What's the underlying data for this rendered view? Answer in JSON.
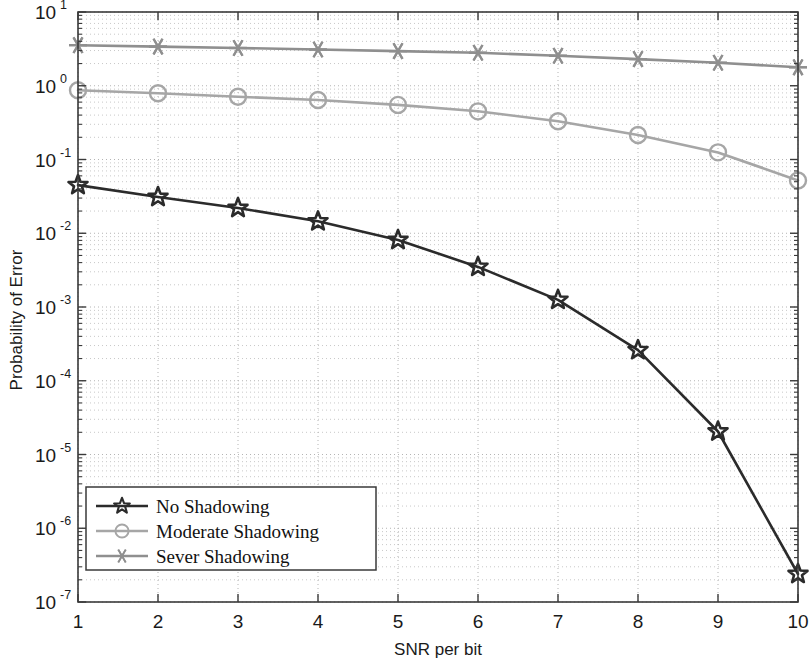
{
  "chart_data": {
    "type": "line",
    "title": "",
    "xlabel": "SNR per bit",
    "ylabel": "Probability of Error",
    "xscale": "linear",
    "yscale": "log",
    "xlim": [
      1,
      10
    ],
    "ylim": [
      1e-07,
      10
    ],
    "grid": true,
    "legend_position": "lower left",
    "x": [
      1,
      2,
      3,
      4,
      5,
      6,
      7,
      8,
      9,
      10
    ],
    "xtick_labels": [
      "1",
      "2",
      "3",
      "4",
      "5",
      "6",
      "7",
      "8",
      "9",
      "10"
    ],
    "ytick_labels": [
      "10⁷",
      "10⁶",
      "10⁵",
      "10⁴",
      "10³",
      "10²",
      "10¹",
      "10⁰",
      "10⁻¹"
    ],
    "ytick_bases": [
      "10",
      "10",
      "10",
      "10",
      "10",
      "10",
      "10",
      "10",
      "10"
    ],
    "ytick_exponents": [
      "1",
      "0",
      "-1",
      "-2",
      "-3",
      "-4",
      "-5",
      "-6",
      "-7"
    ],
    "ytick_values": [
      10,
      1,
      0.1,
      0.01,
      0.001,
      0.0001,
      1e-05,
      1e-06,
      1e-07
    ],
    "series": [
      {
        "name": "No Shadowing",
        "marker": "star-pentagram",
        "color": "#2b2b2b",
        "linewidth": 2.6,
        "values": [
          0.045,
          0.031,
          0.022,
          0.0145,
          0.0081,
          0.0035,
          0.00125,
          0.00026,
          2.05e-05,
          2.4e-07
        ]
      },
      {
        "name": "Moderate Shadowing",
        "marker": "circle",
        "color": "#a6a6a6",
        "linewidth": 2.6,
        "values": [
          0.87,
          0.79,
          0.71,
          0.64,
          0.55,
          0.45,
          0.33,
          0.215,
          0.125,
          0.052
        ]
      },
      {
        "name": "Sever Shadowing",
        "marker": "asterisk",
        "color": "#8f8f8f",
        "linewidth": 2.6,
        "values": [
          3.55,
          3.4,
          3.25,
          3.1,
          2.95,
          2.8,
          2.55,
          2.3,
          2.05,
          1.78
        ]
      }
    ]
  },
  "legend": {
    "entries": [
      {
        "label": "No Shadowing",
        "color": "#2b2b2b",
        "marker": "star-pentagram"
      },
      {
        "label": "Moderate Shadowing",
        "color": "#a6a6a6",
        "marker": "circle"
      },
      {
        "label": "Sever Shadowing",
        "color": "#8f8f8f",
        "marker": "asterisk"
      }
    ]
  },
  "axes": {
    "x_title": "SNR per bit",
    "y_title": "Probability of Error"
  }
}
